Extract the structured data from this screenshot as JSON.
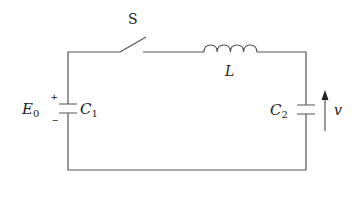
{
  "diagram": {
    "type": "circuit",
    "title": "",
    "components": [
      {
        "id": "S",
        "kind": "switch",
        "state": "open",
        "label": "S"
      },
      {
        "id": "L",
        "kind": "inductor",
        "label": "L"
      },
      {
        "id": "C1",
        "kind": "capacitor",
        "label": "C",
        "label_sub": "1",
        "charge_label": "E",
        "charge_label_sub": "0",
        "polarity_plus": "+",
        "polarity_minus": "−"
      },
      {
        "id": "C2",
        "kind": "capacitor",
        "label": "C",
        "label_sub": "2"
      },
      {
        "id": "v",
        "kind": "voltage-arrow",
        "label": "v",
        "direction": "up"
      }
    ],
    "connections": [
      [
        "C1.top",
        "S.left"
      ],
      [
        "S.right",
        "L.left"
      ],
      [
        "L.right",
        "C2.top"
      ],
      [
        "C2.bottom",
        "C1.bottom"
      ]
    ],
    "colors": {
      "wire": "#555555",
      "text": "#222222",
      "background": "#ffffff"
    }
  }
}
